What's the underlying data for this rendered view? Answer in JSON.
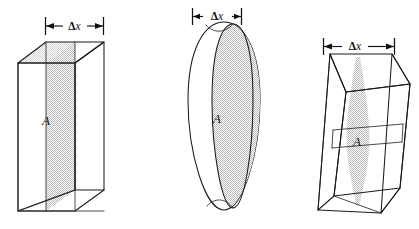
{
  "figure": {
    "background_color": "#ffffff",
    "line_color": "#1a1a1a",
    "shade_color": "#cfcfcf",
    "shade_color_light": "#dedede",
    "caption": "",
    "panels": [
      {
        "id": "panel-prism",
        "shape_name": "rectangular-prism",
        "dimension_label": "Δx",
        "dimension_delta": "Δ",
        "dimension_var": "x",
        "area_label": "A",
        "description": "Rectangular prism with uniform shaded cross-section of area A and thickness Δx"
      },
      {
        "id": "panel-cylinder",
        "shape_name": "cylinder-disk",
        "dimension_label": "Δx",
        "dimension_delta": "Δ",
        "dimension_var": "x",
        "area_label": "A",
        "description": "Circular disk (cylinder seen edge-on) with shaded circular cross-section of area A and thickness Δx"
      },
      {
        "id": "panel-slanted-prism",
        "shape_name": "slanted-prism",
        "dimension_label": "Δx",
        "dimension_delta": "Δ",
        "dimension_var": "x",
        "area_label": "A",
        "description": "Slanted/oblique prism with tapered shaded cross-section of area A and thickness Δx"
      }
    ]
  }
}
